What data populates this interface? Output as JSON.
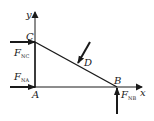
{
  "diagram": {
    "type": "free-body-diagram",
    "axes": {
      "x_label": "x",
      "y_label": "y"
    },
    "points": {
      "A": {
        "label": "A"
      },
      "B": {
        "label": "B"
      },
      "C": {
        "label": "C"
      },
      "D": {
        "label": "D"
      }
    },
    "forces": {
      "F_NC": {
        "main": "F",
        "sub": "NC"
      },
      "F_NA": {
        "main": "F",
        "sub": "NA"
      },
      "F_NB": {
        "main": "F",
        "sub": "NB"
      }
    },
    "colors": {
      "stroke": "#1a1a1a",
      "background": "#ffffff"
    }
  }
}
